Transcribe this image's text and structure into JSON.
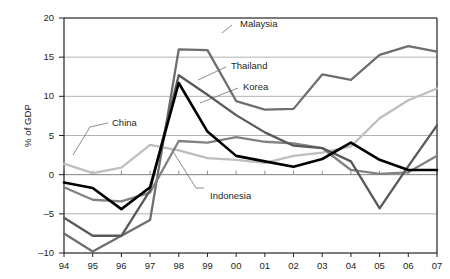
{
  "chart_data": {
    "type": "line",
    "title": "",
    "xlabel": "",
    "ylabel": "% of GDP",
    "ylim": [
      -10,
      20
    ],
    "yticks": [
      -10,
      -5,
      0,
      5,
      10,
      15,
      20
    ],
    "ytick_labels": [
      "–10",
      "–5",
      "0",
      "5",
      "10",
      "15",
      "20"
    ],
    "grid": true,
    "legend_position": "inline-annotations",
    "x": [
      "94",
      "95",
      "96",
      "97",
      "98",
      "99",
      "00",
      "01",
      "02",
      "03",
      "04",
      "05",
      "06",
      "07"
    ],
    "series": [
      {
        "name": "Malaysia",
        "color": "#6d6e71",
        "values": [
          -7.5,
          -9.8,
          -7.8,
          -5.8,
          16.0,
          15.9,
          9.4,
          8.3,
          8.4,
          12.8,
          12.1,
          15.3,
          16.4,
          15.7
        ]
      },
      {
        "name": "Thailand",
        "color": "#58595b",
        "values": [
          -5.5,
          -7.8,
          -7.8,
          -2.0,
          12.7,
          10.2,
          7.6,
          5.4,
          3.7,
          3.4,
          1.7,
          -4.3,
          1.1,
          6.3
        ]
      },
      {
        "name": "Korea",
        "color": "#000000",
        "values": [
          -1.0,
          -1.7,
          -4.4,
          -1.6,
          11.7,
          5.5,
          2.4,
          1.7,
          1.0,
          2.0,
          4.1,
          1.9,
          0.6,
          0.6
        ]
      },
      {
        "name": "China",
        "color": "#bcbec0",
        "values": [
          1.4,
          0.2,
          0.9,
          3.8,
          3.1,
          2.1,
          1.9,
          1.5,
          2.4,
          2.8,
          3.6,
          7.2,
          9.5,
          11.0
        ]
      },
      {
        "name": "Indonesia",
        "color": "#808285",
        "values": [
          -1.6,
          -3.2,
          -3.4,
          -2.3,
          4.3,
          4.1,
          4.8,
          4.2,
          4.0,
          3.4,
          0.6,
          0.1,
          0.3,
          2.4
        ]
      }
    ],
    "annotations": [
      {
        "label": "Malaysia",
        "text_x": 240,
        "text_y": 18,
        "leader": [
          [
            232,
            25
          ],
          [
            222,
            33
          ]
        ]
      },
      {
        "label": "Thailand",
        "text_x": 231,
        "text_y": 60,
        "leader": [
          [
            226,
            67
          ],
          [
            198,
            80
          ]
        ]
      },
      {
        "label": "Korea",
        "text_x": 243,
        "text_y": 81,
        "leader": [
          [
            238,
            88
          ],
          [
            200,
            103
          ]
        ]
      },
      {
        "label": "China",
        "text_x": 112,
        "text_y": 117,
        "leader": [
          [
            108,
            123
          ],
          [
            90,
            127
          ],
          [
            73,
            155
          ]
        ]
      },
      {
        "label": "Indonesia",
        "text_x": 210,
        "text_y": 190,
        "leader": [
          [
            204,
            188
          ],
          [
            196,
            188
          ],
          [
            172,
            150
          ]
        ]
      }
    ]
  }
}
